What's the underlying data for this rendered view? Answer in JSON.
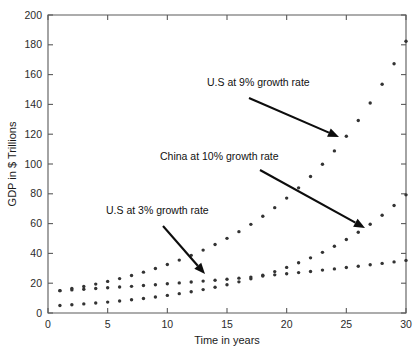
{
  "chart_data": {
    "type": "scatter",
    "title": "",
    "xlabel": "Time in years",
    "ylabel": "GDP in $ Trillions",
    "xlim": [
      0,
      30
    ],
    "ylim": [
      0,
      200
    ],
    "xticks": [
      0,
      5,
      10,
      15,
      20,
      25,
      30
    ],
    "yticks": [
      0,
      20,
      40,
      60,
      80,
      100,
      120,
      140,
      160,
      180,
      200
    ],
    "grid": false,
    "legend": "none (series labelled by annotations)",
    "x": [
      1,
      2,
      3,
      4,
      5,
      6,
      7,
      8,
      9,
      10,
      11,
      12,
      13,
      14,
      15,
      16,
      17,
      18,
      19,
      20,
      21,
      22,
      23,
      24,
      25,
      26,
      27,
      28,
      29,
      30
    ],
    "series": [
      {
        "name": "U.S at 3% growth rate",
        "color": "#333333",
        "values": [
          15.0,
          15.5,
          15.9,
          16.4,
          16.9,
          17.4,
          17.9,
          18.5,
          19.0,
          19.6,
          20.2,
          20.8,
          21.4,
          22.0,
          22.7,
          23.4,
          24.1,
          24.8,
          25.6,
          26.3,
          27.1,
          27.9,
          28.8,
          29.6,
          30.5,
          31.4,
          32.4,
          33.3,
          34.3,
          35.3
        ]
      },
      {
        "name": "U.S at 9% growth rate",
        "color": "#333333",
        "values": [
          15.0,
          16.4,
          17.8,
          19.4,
          21.2,
          23.1,
          25.2,
          27.4,
          29.9,
          32.6,
          35.5,
          38.7,
          42.2,
          46.0,
          50.1,
          54.6,
          59.5,
          64.9,
          70.7,
          77.1,
          84.0,
          91.6,
          99.8,
          108.8,
          118.6,
          129.2,
          140.9,
          153.5,
          167.3,
          182.4
        ]
      },
      {
        "name": "China at 10% growth rate",
        "color": "#333333",
        "values": [
          5.0,
          5.5,
          6.1,
          6.7,
          7.3,
          8.1,
          8.9,
          9.7,
          10.7,
          11.8,
          13.0,
          14.3,
          15.7,
          17.3,
          19.0,
          20.9,
          23.0,
          25.3,
          27.8,
          30.6,
          33.7,
          37.0,
          40.7,
          44.8,
          49.3,
          54.2,
          59.6,
          65.6,
          72.1,
          79.3
        ]
      }
    ],
    "annotations": [
      {
        "text": "U.S at 9% growth rate",
        "text_x": 207,
        "text_y": 86,
        "arrow_from_x": 249,
        "arrow_from_y": 98,
        "arrow_to_x": 339,
        "arrow_to_y": 137
      },
      {
        "text": "China at 10% growth rate",
        "text_x": 160,
        "text_y": 160,
        "arrow_from_x": 260,
        "arrow_from_y": 170,
        "arrow_to_x": 365,
        "arrow_to_y": 228
      },
      {
        "text": "U.S at 3% growth rate",
        "text_x": 106,
        "text_y": 214,
        "arrow_from_x": 163,
        "arrow_from_y": 226,
        "arrow_to_x": 205,
        "arrow_to_y": 274
      }
    ]
  }
}
